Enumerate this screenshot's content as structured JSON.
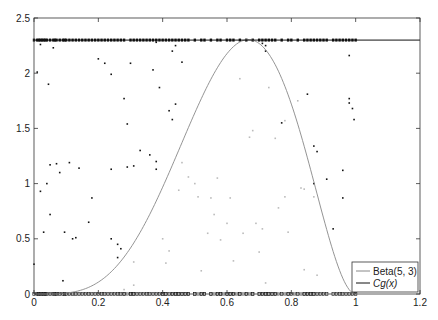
{
  "chart_data": {
    "type": "scatter",
    "title": "",
    "xlabel": "",
    "ylabel": "",
    "xlim": [
      0,
      1.2
    ],
    "ylim": [
      0,
      2.5
    ],
    "xticks": [
      0,
      0.2,
      0.4,
      0.6,
      0.8,
      1,
      1.2
    ],
    "xtick_labels": [
      "0",
      "0.2",
      "0.4",
      "0.6",
      "0.8",
      "1",
      "1.2"
    ],
    "yticks": [
      0,
      0.5,
      1,
      1.5,
      2,
      2.5
    ],
    "ytick_labels": [
      "0",
      "0.5",
      "1",
      "1.5",
      "2",
      "2.5"
    ],
    "grid": false,
    "legend_position": "lower right",
    "legend": [
      {
        "label": "Beta(5, 3)",
        "color": "#888888"
      },
      {
        "label": "Cg(x)",
        "color": "#111111"
      }
    ],
    "series": [
      {
        "name": "Beta(5, 3)",
        "type": "line",
        "color": "#888888",
        "formula": "105*x^4*(1-x)^2",
        "x_range": [
          0,
          1
        ]
      },
      {
        "name": "Cg(x)",
        "type": "line",
        "color": "#111111",
        "y_constant": 2.3,
        "x_range": [
          0,
          1.2
        ]
      },
      {
        "name": "rejected",
        "type": "scatter",
        "color": "#111111",
        "points": [
          [
            0.0,
            0.27
          ],
          [
            0.01,
            2.01
          ],
          [
            0.02,
            2.26
          ],
          [
            0.02,
            0.93
          ],
          [
            0.03,
            0.56
          ],
          [
            0.04,
            1.0
          ],
          [
            0.045,
            1.9
          ],
          [
            0.05,
            1.17
          ],
          [
            0.05,
            0.72
          ],
          [
            0.06,
            2.23
          ],
          [
            0.07,
            1.18
          ],
          [
            0.08,
            1.1
          ],
          [
            0.09,
            0.12
          ],
          [
            0.095,
            0.56
          ],
          [
            0.11,
            1.19
          ],
          [
            0.12,
            0.5
          ],
          [
            0.13,
            0.51
          ],
          [
            0.14,
            1.14
          ],
          [
            0.17,
            0.65
          ],
          [
            0.18,
            0.87
          ],
          [
            0.2,
            2.13
          ],
          [
            0.22,
            2.09
          ],
          [
            0.24,
            1.99
          ],
          [
            0.24,
            1.13
          ],
          [
            0.24,
            0.5
          ],
          [
            0.26,
            0.45
          ],
          [
            0.27,
            0.41
          ],
          [
            0.26,
            0.33
          ],
          [
            0.28,
            1.77
          ],
          [
            0.29,
            1.54
          ],
          [
            0.29,
            1.15
          ],
          [
            0.3,
            2.09
          ],
          [
            0.31,
            1.16
          ],
          [
            0.33,
            1.3
          ],
          [
            0.36,
            1.26
          ],
          [
            0.38,
            1.13
          ],
          [
            0.37,
            2.03
          ],
          [
            0.38,
            1.2
          ],
          [
            0.39,
            1.87
          ],
          [
            0.38,
            2.28
          ],
          [
            0.42,
            1.66
          ],
          [
            0.43,
            2.2
          ],
          [
            0.43,
            1.58
          ],
          [
            0.44,
            1.72
          ],
          [
            0.44,
            2.25
          ],
          [
            0.46,
            2.1
          ],
          [
            0.71,
            2.27
          ],
          [
            0.72,
            2.25
          ],
          [
            0.72,
            2.2
          ],
          [
            0.77,
            1.55
          ],
          [
            0.85,
            1.81
          ],
          [
            0.87,
            1.34
          ],
          [
            0.88,
            1.29
          ],
          [
            0.91,
            1.04
          ],
          [
            0.93,
            0.59
          ],
          [
            0.96,
            1.12
          ],
          [
            0.98,
            2.16
          ],
          [
            0.98,
            1.77
          ],
          [
            0.98,
            1.73
          ],
          [
            0.99,
            1.68
          ],
          [
            0.995,
            1.58
          ],
          [
            0.87,
            1.0
          ],
          [
            0.96,
            0.87
          ]
        ]
      },
      {
        "name": "accepted",
        "type": "scatter",
        "color": "#bbbbbb",
        "points": [
          [
            0.28,
            0.04
          ],
          [
            0.31,
            0.08
          ],
          [
            0.31,
            0.29
          ],
          [
            0.4,
            0.5
          ],
          [
            0.41,
            0.28
          ],
          [
            0.42,
            0.39
          ],
          [
            0.45,
            0.94
          ],
          [
            0.46,
            1.19
          ],
          [
            0.48,
            1.06
          ],
          [
            0.51,
            0.88
          ],
          [
            0.52,
            0.21
          ],
          [
            0.55,
            0.87
          ],
          [
            0.56,
            0.72
          ],
          [
            0.57,
            1.05
          ],
          [
            0.58,
            0.49
          ],
          [
            0.6,
            0.64
          ],
          [
            0.61,
            0.87
          ],
          [
            0.62,
            0.3
          ],
          [
            0.65,
            0.55
          ],
          [
            0.67,
            1.42
          ],
          [
            0.68,
            1.48
          ],
          [
            0.69,
            0.64
          ],
          [
            0.7,
            0.38
          ],
          [
            0.71,
            0.59
          ],
          [
            0.72,
            0.1
          ],
          [
            0.73,
            1.87
          ],
          [
            0.75,
            1.41
          ],
          [
            0.76,
            0.78
          ],
          [
            0.78,
            0.88
          ],
          [
            0.82,
            1.75
          ],
          [
            0.83,
            0.96
          ],
          [
            0.84,
            0.95
          ],
          [
            0.78,
            1.57
          ],
          [
            0.79,
            0.56
          ],
          [
            0.84,
            0.22
          ],
          [
            0.87,
            0.88
          ],
          [
            0.54,
            0.55
          ],
          [
            0.5,
            1.0
          ],
          [
            0.64,
            1.95
          ],
          [
            0.88,
            0.17
          ]
        ]
      },
      {
        "name": "accepted-rug",
        "type": "rug",
        "color": "#777777",
        "x": [
          0.28,
          0.29,
          0.3,
          0.31,
          0.4,
          0.41,
          0.43,
          0.44,
          0.45,
          0.46,
          0.47,
          0.48,
          0.5,
          0.51,
          0.52,
          0.53,
          0.55,
          0.56,
          0.57,
          0.58,
          0.59,
          0.6,
          0.61,
          0.62,
          0.63,
          0.64,
          0.65,
          0.66,
          0.67,
          0.68,
          0.7,
          0.71,
          0.72,
          0.73,
          0.74,
          0.75,
          0.76,
          0.78,
          0.79,
          0.81,
          0.83,
          0.84,
          0.85,
          0.86,
          0.87
        ]
      },
      {
        "name": "rejected-rug",
        "type": "rug",
        "color": "#111111",
        "x": [
          0.0,
          0.01,
          0.015,
          0.02,
          0.025,
          0.03,
          0.035,
          0.04,
          0.05,
          0.06,
          0.065,
          0.07,
          0.08,
          0.09,
          0.095,
          0.1,
          0.11,
          0.12,
          0.13,
          0.14,
          0.15,
          0.16,
          0.17,
          0.18,
          0.19,
          0.2,
          0.21,
          0.22,
          0.23,
          0.24,
          0.25,
          0.26,
          0.27,
          0.28,
          0.3,
          0.31,
          0.32,
          0.33,
          0.34,
          0.35,
          0.36,
          0.37,
          0.38,
          0.39,
          0.4,
          0.41,
          0.42,
          0.43,
          0.44,
          0.45,
          0.46,
          0.47,
          0.48,
          0.5,
          0.52,
          0.53,
          0.55,
          0.57,
          0.58,
          0.6,
          0.61,
          0.62,
          0.64,
          0.66,
          0.68,
          0.7,
          0.71,
          0.72,
          0.73,
          0.74,
          0.75,
          0.77,
          0.79,
          0.8,
          0.82,
          0.84,
          0.85,
          0.86,
          0.87,
          0.88,
          0.89,
          0.9,
          0.91,
          0.93,
          0.94,
          0.95,
          0.96,
          0.97,
          0.98,
          0.99,
          1.0
        ]
      }
    ]
  },
  "layout": {
    "plot_left": 34,
    "plot_right": 420,
    "plot_top": 18,
    "plot_bottom": 294
  }
}
